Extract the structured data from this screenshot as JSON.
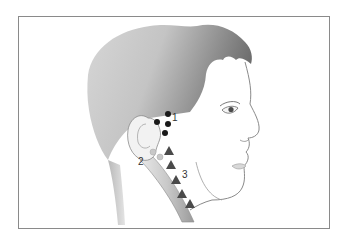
{
  "figure": {
    "labels": [
      {
        "id": "1",
        "text": "1",
        "marker": "circle",
        "region": "preauricular"
      },
      {
        "id": "2",
        "text": "2",
        "marker": "circle-light",
        "region": "postauricular / mastoid"
      },
      {
        "id": "3",
        "text": "3",
        "marker": "triangle",
        "region": "anterior cervical chain"
      }
    ],
    "colors": {
      "frame": "#8a8a8a",
      "hair_dark": "#6e6e6e",
      "hair_light": "#d2d2d2",
      "skin_line": "#7a7a7a",
      "dot": "#1a1a1a",
      "triangle": "#4a4a4a",
      "light_node": "#c8c8c8"
    }
  }
}
